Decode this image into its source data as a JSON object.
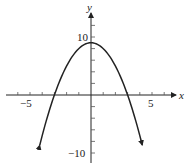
{
  "chart_data": {
    "type": "line",
    "title": "",
    "xlabel": "x",
    "ylabel": "y",
    "function": "y = 9 - x^2",
    "xlim": [
      -6.5,
      7
    ],
    "ylim": [
      -11,
      13
    ],
    "xticks": [
      -6,
      -5,
      -4,
      -3,
      -2,
      -1,
      1,
      2,
      3,
      4,
      5,
      6
    ],
    "xtick_labels": [
      {
        "value": -5,
        "label": "−5"
      },
      {
        "value": 5,
        "label": "5"
      }
    ],
    "yticks": [
      -10,
      -8,
      -6,
      -4,
      -2,
      2,
      4,
      6,
      8,
      10,
      12
    ],
    "ytick_labels": [
      {
        "value": 10,
        "label": "10"
      },
      {
        "value": -10,
        "label": "−10"
      }
    ],
    "series": [
      {
        "name": "parabola",
        "x": [
          -4.2,
          -4,
          -3.5,
          -3,
          -2.5,
          -2,
          -1.5,
          -1,
          -0.5,
          0,
          0.5,
          1,
          1.5,
          2,
          2.5,
          3,
          3.5,
          4,
          4.2
        ],
        "y": [
          -8.64,
          -7,
          -3.25,
          0,
          2.75,
          5,
          6.75,
          8,
          8.75,
          9,
          8.75,
          8,
          6.75,
          5,
          2.75,
          0,
          -3.25,
          -7,
          -8.64
        ]
      }
    ],
    "annotations": [
      "arrowheads at both ends of curve",
      "arrow at positive ends of axes"
    ],
    "grid": false
  },
  "labels": {
    "x_axis": "x",
    "y_axis": "y",
    "x_neg5": "−5",
    "x_pos5": "5",
    "y_pos10": "10",
    "y_neg10": "−10"
  }
}
